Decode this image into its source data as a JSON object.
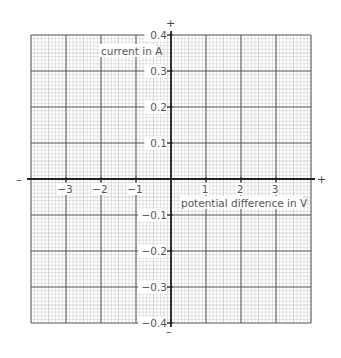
{
  "chart_data": {
    "type": "line",
    "title": "",
    "xlabel": "potential difference in V",
    "ylabel": "current in A",
    "xlim": [
      -4,
      4
    ],
    "ylim": [
      -0.4,
      0.4
    ],
    "x_ticks": [
      -3,
      -2,
      -1,
      1,
      2,
      3
    ],
    "x_tick_labels": [
      "−3",
      "−2",
      "−1",
      "1",
      "2",
      "3"
    ],
    "y_ticks": [
      0.4,
      0.3,
      0.2,
      0.1,
      -0.1,
      -0.2,
      -0.3,
      -0.4
    ],
    "y_tick_labels": [
      "0.4",
      "0.3",
      "0.2",
      "0.1",
      "−0.1",
      "−0.2",
      "−0.3",
      "−0.4"
    ],
    "grid": true,
    "series": [],
    "axis_signs": {
      "x_positive": "+",
      "x_negative": "–",
      "y_positive": "+",
      "y_negative": "–"
    }
  },
  "colors": {
    "major_grid": "#555555",
    "minor_grid": "#c8c8c8",
    "axis": "#222222",
    "label": "#555555"
  }
}
